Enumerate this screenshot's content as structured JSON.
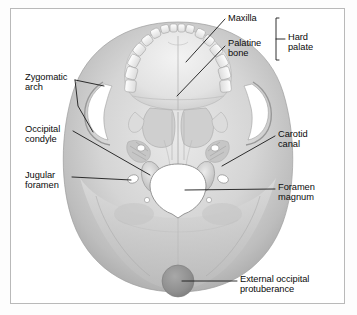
{
  "figure": {
    "kind": "anatomical-illustration",
    "frame_color": "#b9b9b9",
    "background_color": "#ffffff",
    "label_color": "#0b0b0b",
    "leader_color": "#1a1a1a"
  },
  "labels": [
    {
      "id": "maxilla",
      "text": "Maxilla",
      "x": 228,
      "y": 14,
      "side": "right"
    },
    {
      "id": "palatine-bone",
      "text": "Palatine\nbone",
      "x": 228,
      "y": 40,
      "side": "right"
    },
    {
      "id": "hard-palate",
      "text": "Hard\npalate",
      "x": 288,
      "y": 32,
      "side": "right"
    },
    {
      "id": "zygomatic-arch",
      "text": "Zygomatic\narch",
      "x": 26,
      "y": 77,
      "side": "left"
    },
    {
      "id": "occipital-condyle",
      "text": "Occipital\ncondyle",
      "x": 26,
      "y": 126,
      "side": "left"
    },
    {
      "id": "jugular-foramen",
      "text": "Jugular\nforamen",
      "x": 26,
      "y": 172,
      "side": "left"
    },
    {
      "id": "carotid-canal",
      "text": "Carotid\ncanal",
      "x": 278,
      "y": 131,
      "side": "right"
    },
    {
      "id": "foramen-magnum",
      "text": "Foramen\nmagnum",
      "x": 278,
      "y": 183,
      "side": "right"
    },
    {
      "id": "external-occipital-protuberance",
      "text": "External occipital\nprotuberance",
      "x": 240,
      "y": 276,
      "side": "right"
    }
  ],
  "brackets": [
    {
      "id": "hard-palate-bracket",
      "x": 276,
      "y_top": 18,
      "y_bottom": 60,
      "tick_y": 39
    }
  ],
  "leaders": [
    {
      "id": "maxilla-leader",
      "points": "225,19 186,62"
    },
    {
      "id": "palatine-bone-leader",
      "points": "225,46 177,96"
    },
    {
      "id": "zygomatic-arch-upper",
      "points": "75,80 104,86"
    },
    {
      "id": "zygomatic-arch-lower",
      "points": "75,80 78,106 93,132"
    },
    {
      "id": "occipital-condyle-leader",
      "points": "73,131 150,175"
    },
    {
      "id": "jugular-foramen-leader",
      "points": "72,177 131,180"
    },
    {
      "id": "carotid-canal-leader",
      "points": "275,136 222,166"
    },
    {
      "id": "foramen-magnum-leader",
      "points": "275,189 185,190"
    },
    {
      "id": "eop-leader",
      "points": "237,281 182,281"
    }
  ],
  "anatomy_features": [
    {
      "id": "foramen-magnum-opening",
      "type": "aperture",
      "fill": "#ffffff"
    },
    {
      "id": "dental-arcade",
      "type": "teeth-row"
    },
    {
      "id": "hard-palate-surface",
      "type": "bone-plate"
    },
    {
      "id": "zygomatic-arch-left",
      "type": "arch"
    },
    {
      "id": "zygomatic-arch-right",
      "type": "arch"
    },
    {
      "id": "occipital-condyle-left",
      "type": "condyle"
    },
    {
      "id": "occipital-condyle-right",
      "type": "condyle"
    },
    {
      "id": "jugular-foramen-left",
      "type": "foramen",
      "fill": "#ffffff"
    },
    {
      "id": "jugular-foramen-right",
      "type": "foramen",
      "fill": "#ffffff"
    },
    {
      "id": "carotid-canal-left",
      "type": "canal",
      "fill": "#ffffff"
    },
    {
      "id": "carotid-canal-right",
      "type": "canal",
      "fill": "#ffffff"
    },
    {
      "id": "external-occipital-protuberance-bump",
      "type": "protuberance",
      "fill": "#9b9b9b"
    },
    {
      "id": "occipital-bone-dome",
      "type": "cranial-vault"
    }
  ]
}
